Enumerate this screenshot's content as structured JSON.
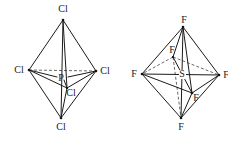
{
  "figure": {
    "colors": {
      "line": "#1a1a1a",
      "dashed_line": "#444444",
      "background": "#ffffff"
    },
    "pcl5": {
      "name": "PCl5 trigonal bipyramid",
      "central_atom": "P",
      "labels": {
        "top": "Cl",
        "left": "Cl",
        "right": "Cl",
        "front": "Cl",
        "bottom": "Cl",
        "center": "P"
      }
    },
    "sf6": {
      "name": "SF6 octahedron",
      "central_atom": "S",
      "labels": {
        "top": "F",
        "left": "F",
        "right": "F",
        "back": "F",
        "front": "F",
        "bottom": "F",
        "center": "S"
      }
    }
  }
}
